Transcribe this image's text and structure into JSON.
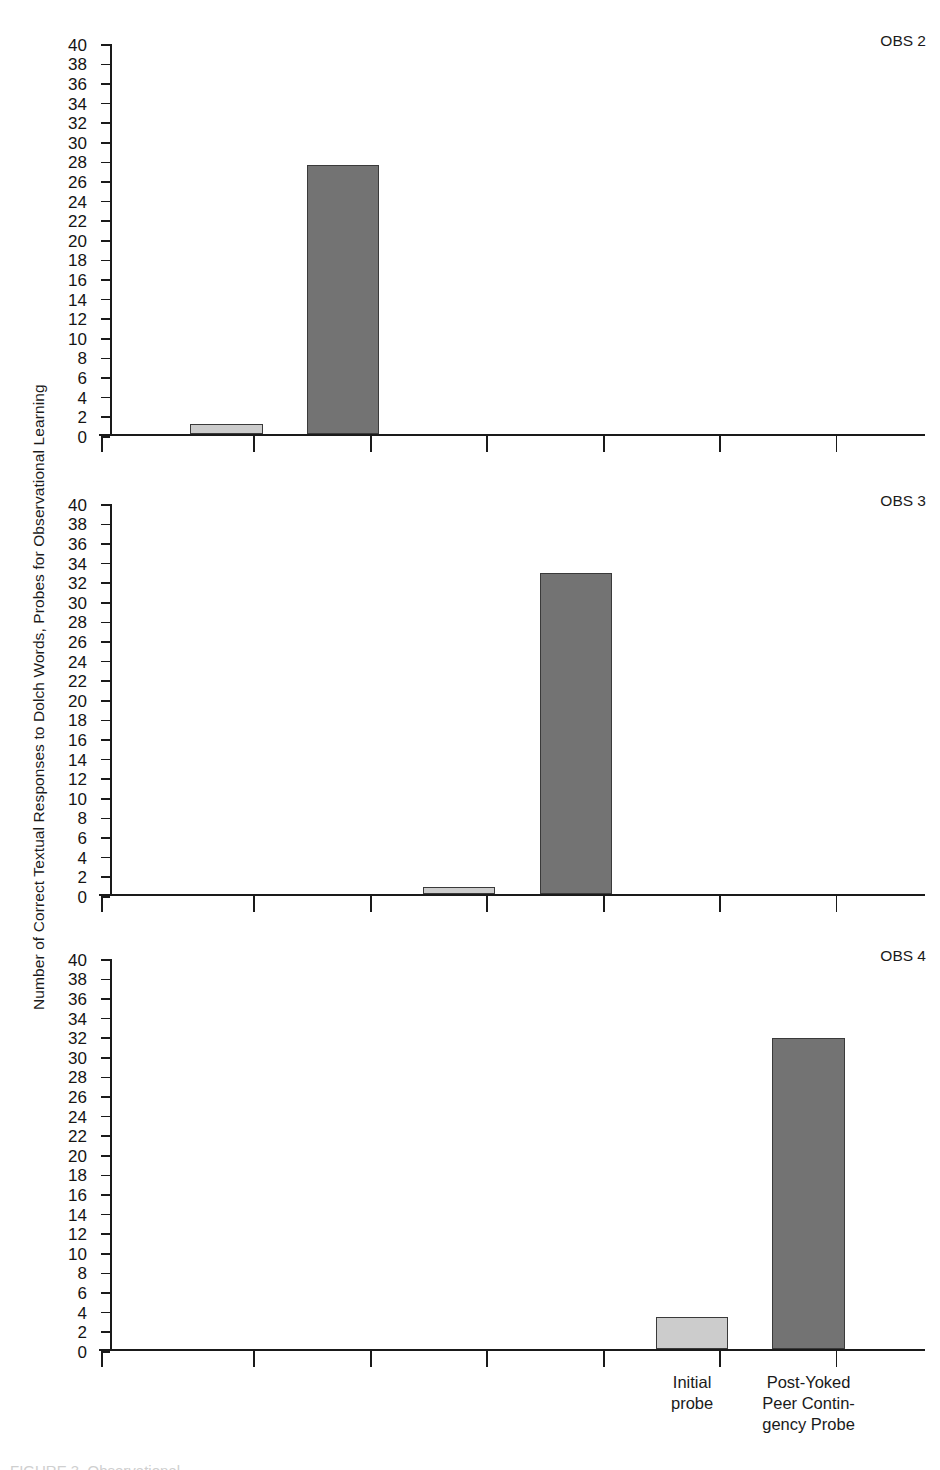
{
  "figure": {
    "ylabel": "Number of Correct Textual Responses to Dolch Words, Probes for Observational Learning",
    "caption_partial": "FIGURE 3.  Observational"
  },
  "colors": {
    "bar_light": "#cccccc",
    "bar_dark": "#737373",
    "bar_edge": "#3a3a3a",
    "axis": "#1a1a1a",
    "text": "#1a1a1a"
  },
  "chart_data": {
    "type": "bar",
    "title": "",
    "subtitle": "",
    "xlabel": "",
    "ylabel": "Number of Correct Textual Responses to Dolch Words, Probes for Observational Learning",
    "ylim": [
      0,
      40
    ],
    "ytick_step": 2,
    "yticks": [
      0,
      2,
      4,
      6,
      8,
      10,
      12,
      14,
      16,
      18,
      20,
      22,
      24,
      26,
      28,
      30,
      32,
      34,
      36,
      38,
      40
    ],
    "grid": false,
    "legend": "none",
    "x_slots": 6,
    "x_tick_count": 7,
    "categories": [
      "Initial probe",
      "Post-Yoked Peer Contin-gency Probe"
    ],
    "category_lines": [
      [
        "Initial",
        "probe"
      ],
      [
        "Post-Yoked",
        "Peer Contin-",
        "gency Probe"
      ]
    ],
    "panels": [
      {
        "label": "OBS 2",
        "bars": [
          {
            "slot": 1,
            "value": 1.0,
            "series": "Initial probe",
            "style": "light"
          },
          {
            "slot": 2,
            "value": 27.4,
            "series": "Post-Yoked Peer Contingency Probe",
            "style": "dark"
          }
        ]
      },
      {
        "label": "OBS 3",
        "bars": [
          {
            "slot": 3,
            "value": 0.7,
            "series": "Initial probe",
            "style": "light"
          },
          {
            "slot": 4,
            "value": 32.8,
            "series": "Post-Yoked Peer Contingency Probe",
            "style": "dark"
          }
        ]
      },
      {
        "label": "OBS 4",
        "bars": [
          {
            "slot": 5,
            "value": 3.3,
            "series": "Initial probe",
            "style": "light"
          },
          {
            "slot": 6,
            "value": 31.7,
            "series": "Post-Yoked Peer Contingency Probe",
            "style": "dark"
          }
        ]
      }
    ]
  }
}
